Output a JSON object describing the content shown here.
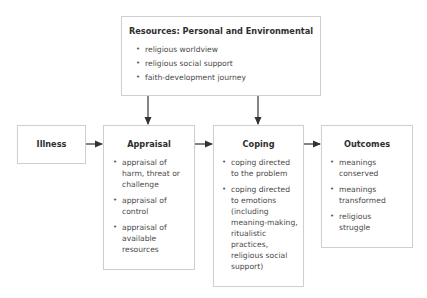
{
  "resources": {
    "title": "Resources: Personal and Environmental",
    "items": [
      "religious worldview",
      "religious social support",
      "faith-development journey"
    ]
  },
  "illness": {
    "title": "Illness"
  },
  "appraisal": {
    "title": "Appraisal",
    "items": [
      "appraisal of harm, threat or challenge",
      "appraisal of control",
      "appraisal of available resources"
    ]
  },
  "coping": {
    "title": "Coping",
    "items": [
      "coping directed to the problem",
      "coping directed to emotions (including meaning-making, ritualistic practices, religious social support)"
    ]
  },
  "outcomes": {
    "title": "Outcomes",
    "items": [
      "meanings conserved",
      "meanings transformed",
      "religious struggle"
    ]
  },
  "colors": {
    "border": "#cfcfcf",
    "arrow": "#333333",
    "text": "#4a4a4a"
  }
}
